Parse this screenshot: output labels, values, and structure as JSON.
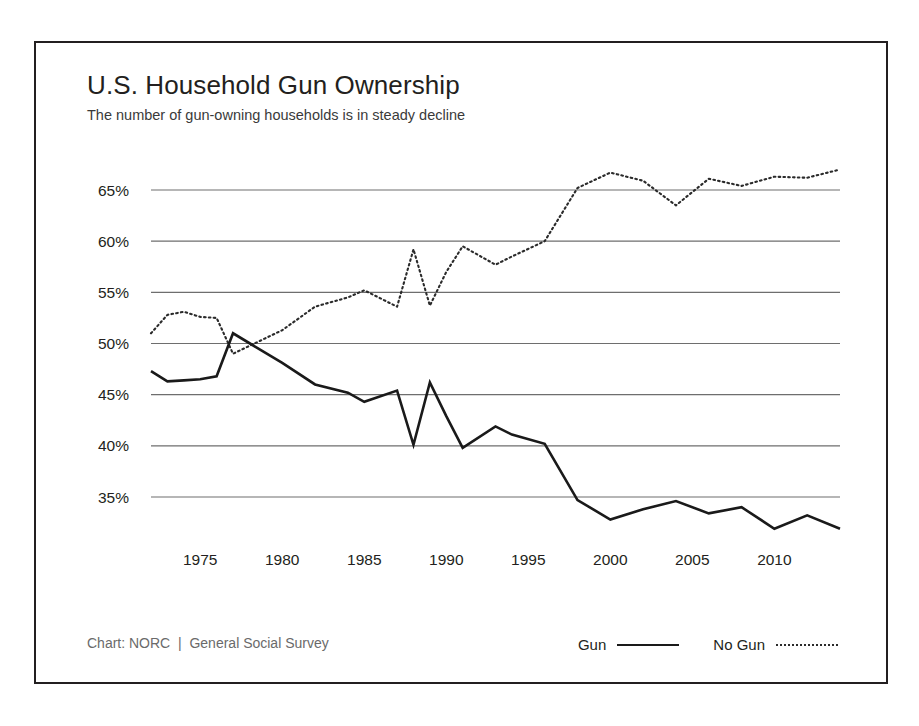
{
  "chart_card": {
    "title": "U.S. Household Gun Ownership",
    "subtitle": "The number of gun-owning households is in steady decline",
    "credit": "Chart: NORC  |  General Social Survey"
  },
  "legend": {
    "position": "bottom-right",
    "entries": [
      {
        "label": "Gun",
        "style": "solid",
        "color": "#1a1a1a"
      },
      {
        "label": "No Gun",
        "style": "dotted",
        "color": "#2b2b2b"
      }
    ]
  },
  "axes": {
    "y_ticks": [
      "65%",
      "60%",
      "55%",
      "50%",
      "45%",
      "40%",
      "35%"
    ],
    "x_ticks": [
      "1975",
      "1980",
      "1985",
      "1990",
      "1995",
      "2000",
      "2005",
      "2010"
    ]
  },
  "chart_data": {
    "type": "line",
    "title": "U.S. Household Gun Ownership",
    "subtitle": "The number of gun-owning households is in steady decline",
    "xlabel": "",
    "ylabel": "",
    "xlim": [
      1972,
      2014
    ],
    "ylim": [
      31,
      68
    ],
    "grid": true,
    "y_tick_values": [
      65,
      60,
      55,
      50,
      45,
      40,
      35
    ],
    "x_tick_values": [
      1975,
      1980,
      1985,
      1990,
      1995,
      2000,
      2005,
      2010
    ],
    "legend_position": "bottom-right",
    "source": "Chart: NORC  |  General Social Survey",
    "x": [
      1972,
      1973,
      1974,
      1975,
      1976,
      1977,
      1980,
      1982,
      1984,
      1985,
      1987,
      1988,
      1989,
      1990,
      1991,
      1993,
      1994,
      1996,
      1998,
      2000,
      2002,
      2004,
      2006,
      2008,
      2010,
      2012,
      2014
    ],
    "series": [
      {
        "name": "Gun",
        "style": "solid",
        "color": "#1a1a1a",
        "values": [
          47.3,
          46.3,
          46.4,
          46.5,
          46.8,
          51.0,
          48.1,
          46.0,
          45.2,
          44.3,
          45.4,
          40.1,
          46.2,
          42.9,
          39.8,
          41.9,
          41.1,
          40.2,
          34.7,
          32.8,
          33.8,
          34.6,
          33.4,
          34.0,
          31.9,
          33.2,
          31.9
        ]
      },
      {
        "name": "No Gun",
        "style": "dotted",
        "color": "#2b2b2b",
        "values": [
          51.0,
          52.8,
          53.1,
          52.6,
          52.5,
          49.0,
          51.3,
          53.6,
          54.5,
          55.2,
          53.6,
          59.2,
          53.7,
          57.0,
          59.5,
          57.7,
          58.5,
          60.0,
          65.2,
          66.7,
          65.9,
          63.5,
          66.1,
          65.4,
          66.3,
          66.2,
          67.0
        ]
      }
    ]
  }
}
